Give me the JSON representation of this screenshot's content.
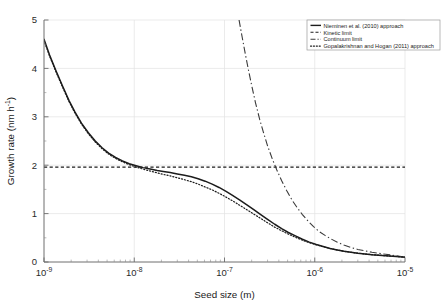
{
  "chart_data": {
    "type": "line",
    "title": "",
    "xlabel": "Seed size (m)",
    "ylabel": "Growth rate (nm h",
    "ylabel_exponent": "-1",
    "ylabel_close": ")",
    "xscale": "log",
    "yscale": "linear",
    "xlim": [
      1e-09,
      1e-05
    ],
    "ylim": [
      0,
      5
    ],
    "grid": true,
    "legend_position": "top-right",
    "xtick_labels": [
      "10",
      "10",
      "10",
      "10",
      "10"
    ],
    "xtick_exponents": [
      "-9",
      "-8",
      "-7",
      "-6",
      "-5"
    ],
    "xtick_values": [
      1e-09,
      1e-08,
      1e-07,
      1e-06,
      1e-05
    ],
    "ytick_labels": [
      "0",
      "1",
      "2",
      "3",
      "4",
      "5"
    ],
    "ytick_values": [
      0,
      1,
      2,
      3,
      4,
      5
    ],
    "series": [
      {
        "name": "Nieminen et al. (2010) approach",
        "style": "solid",
        "x": [
          1e-09,
          1.15e-09,
          1.35e-09,
          1.6e-09,
          1.9e-09,
          2.2e-09,
          2.6e-09,
          3.1e-09,
          3.7e-09,
          4.4e-09,
          5.2e-09,
          6.2e-09,
          7.4e-09,
          8.8e-09,
          1.05e-08,
          1.25e-08,
          1.5e-08,
          1.8e-08,
          2.1e-08,
          2.5e-08,
          3e-08,
          3.6e-08,
          4.3e-08,
          5.1e-08,
          6.1e-08,
          7.3e-08,
          8.7e-08,
          1.04e-07,
          1.24e-07,
          1.48e-07,
          1.77e-07,
          2.11e-07,
          2.52e-07,
          3e-07,
          3.6e-07,
          4.3e-07,
          5.1e-07,
          6.1e-07,
          7.3e-07,
          8.7e-07,
          1.04e-06,
          1.24e-06,
          1.48e-06,
          1.77e-06,
          2.11e-06,
          2.52e-06,
          3e-06,
          3.6e-06,
          4.3e-06,
          5.1e-06,
          6.1e-06,
          7.3e-06,
          8.7e-06,
          1e-05
        ],
        "y": [
          4.6,
          4.28,
          3.96,
          3.64,
          3.33,
          3.1,
          2.87,
          2.67,
          2.5,
          2.36,
          2.25,
          2.16,
          2.09,
          2.03,
          1.99,
          1.95,
          1.92,
          1.89,
          1.87,
          1.85,
          1.82,
          1.79,
          1.76,
          1.72,
          1.67,
          1.61,
          1.54,
          1.46,
          1.37,
          1.28,
          1.18,
          1.08,
          0.98,
          0.88,
          0.78,
          0.69,
          0.61,
          0.54,
          0.47,
          0.41,
          0.36,
          0.32,
          0.28,
          0.25,
          0.22,
          0.2,
          0.18,
          0.165,
          0.15,
          0.14,
          0.13,
          0.12,
          0.11,
          0.1
        ]
      },
      {
        "name": "Kinetic limit",
        "style": "dashed",
        "x": [
          1e-09,
          1e-05
        ],
        "y": [
          1.96,
          1.96
        ]
      },
      {
        "name": "Continuum limit",
        "style": "dashdot",
        "x": [
          1.45e-07,
          1.55e-07,
          1.7e-07,
          1.85e-07,
          2e-07,
          2.2e-07,
          2.45e-07,
          2.7e-07,
          3e-07,
          3.4e-07,
          3.8e-07,
          4.3e-07,
          4.9e-07,
          5.6e-07,
          6.4e-07,
          7.3e-07,
          8.4e-07,
          9.7e-07,
          1.12e-06,
          1.3e-06,
          1.5e-06,
          1.78e-06,
          2.1e-06,
          2.5e-06,
          3e-06,
          3.6e-06,
          4.3e-06,
          5.1e-06,
          6.1e-06,
          7.3e-06,
          8.7e-06,
          1e-05
        ],
        "y": [
          5.0,
          4.7,
          4.3,
          3.95,
          3.65,
          3.3,
          2.95,
          2.68,
          2.4,
          2.12,
          1.9,
          1.68,
          1.47,
          1.28,
          1.12,
          0.98,
          0.85,
          0.73,
          0.63,
          0.55,
          0.48,
          0.41,
          0.35,
          0.3,
          0.26,
          0.23,
          0.2,
          0.18,
          0.16,
          0.14,
          0.12,
          0.105
        ]
      },
      {
        "name": "Gopalakrishnan and Hogan (2011) approach",
        "style": "dotted",
        "x": [
          1e-09,
          1.15e-09,
          1.35e-09,
          1.6e-09,
          1.9e-09,
          2.2e-09,
          2.6e-09,
          3.1e-09,
          3.7e-09,
          4.4e-09,
          5.2e-09,
          6.2e-09,
          7.4e-09,
          8.8e-09,
          1.05e-08,
          1.25e-08,
          1.5e-08,
          1.8e-08,
          2.1e-08,
          2.5e-08,
          3e-08,
          3.6e-08,
          4.3e-08,
          5.1e-08,
          6.1e-08,
          7.3e-08,
          8.7e-08,
          1.04e-07,
          1.24e-07,
          1.48e-07,
          1.77e-07,
          2.11e-07,
          2.52e-07,
          3e-07,
          3.6e-07,
          4.3e-07,
          5.1e-07,
          6.1e-07,
          7.3e-07,
          8.7e-07,
          1.04e-06,
          1.24e-06,
          1.48e-06,
          1.77e-06,
          2.11e-06,
          2.52e-06,
          3e-06,
          3.6e-06,
          4.3e-06,
          5.1e-06,
          6.1e-06,
          7.3e-06,
          8.7e-06,
          1e-05
        ],
        "y": [
          4.58,
          4.26,
          3.94,
          3.62,
          3.31,
          3.08,
          2.85,
          2.65,
          2.48,
          2.34,
          2.23,
          2.14,
          2.07,
          2.01,
          1.96,
          1.92,
          1.88,
          1.84,
          1.81,
          1.78,
          1.74,
          1.7,
          1.66,
          1.61,
          1.55,
          1.49,
          1.42,
          1.34,
          1.26,
          1.17,
          1.08,
          0.99,
          0.9,
          0.81,
          0.72,
          0.645,
          0.575,
          0.51,
          0.45,
          0.4,
          0.355,
          0.315,
          0.28,
          0.25,
          0.222,
          0.2,
          0.182,
          0.166,
          0.152,
          0.14,
          0.13,
          0.12,
          0.11,
          0.1
        ]
      }
    ]
  }
}
